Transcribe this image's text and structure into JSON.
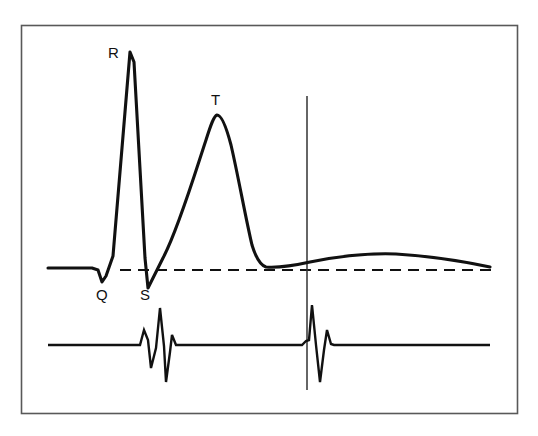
{
  "figure": {
    "kind": "ecg-waveform-diagram",
    "background_color": "#ffffff",
    "border_color": "#595959",
    "trace_color": "#111111",
    "baseline_color": "#111111",
    "marker_line_color": "#333333",
    "frame": {
      "x": 21,
      "y": 25,
      "width": 497,
      "height": 389
    }
  },
  "labels": {
    "r_wave": "R",
    "t_wave": "T",
    "q_wave": "Q",
    "s_wave": "S"
  },
  "chart_data": {
    "type": "line",
    "title": "",
    "xlabel": "",
    "ylabel": "",
    "grid": false,
    "legend": "none",
    "annotations": [
      {
        "text": "R",
        "x": 130,
        "y": 52,
        "role": "r-wave-peak"
      },
      {
        "text": "T",
        "x": 217,
        "y": 115,
        "role": "t-wave-peak"
      },
      {
        "text": "Q",
        "x": 102,
        "y": 282,
        "role": "q-wave-trough"
      },
      {
        "text": "S",
        "x": 148,
        "y": 288,
        "role": "s-wave-trough"
      }
    ],
    "series": [
      {
        "name": "monophasic-action-potential",
        "baseline_y": 268,
        "path": "M48,268 L92,268 L98,270 L102,282 L106,276 L113,256 L130,52 L134,62 L145,258 L148,288 L152,280 L158,268 L163,258 C178,230 196,170 206,140 C211,124 214,116 217,115 C221,115 226,126 231,145 C238,175 246,220 252,245 C256,258 260,265 266,267 C280,268 292,266 310,262 C340,256 370,253 396,254 C430,256 466,262 490,267"
      },
      {
        "name": "surface-ecg-lead",
        "baseline_y": 345,
        "path": "M48,345 L140,345 L144,330 L148,340 L151,368 L156,348 L160,308 L164,346 L166,382 L170,352 L172,335 L176,345 L302,345 L306,341 L309,340 L312,305 L316,345 L320,382 L324,350 L327,330 L331,344 L334,345 L490,345"
      }
    ],
    "reference_lines": [
      {
        "name": "isoelectric-baseline",
        "orientation": "horizontal",
        "style": "dashed",
        "y": 270,
        "x_start": 120,
        "x_end": 492
      },
      {
        "name": "timing-marker",
        "orientation": "vertical",
        "style": "solid",
        "x": 307,
        "y_start": 96,
        "y_end": 390
      }
    ]
  }
}
